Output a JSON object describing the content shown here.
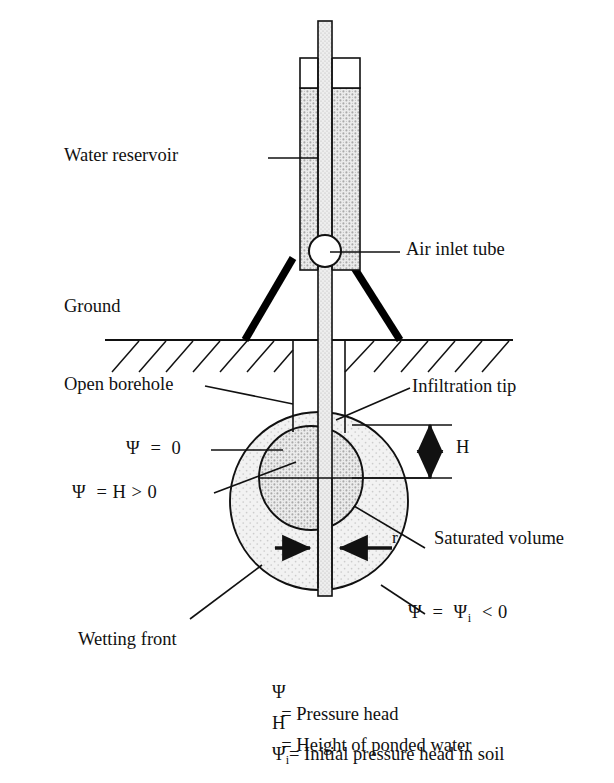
{
  "figure": {
    "type": "technical-diagram"
  },
  "labels": {
    "water_reservoir": "Water reservoir",
    "air_inlet_tube": "Air inlet tube",
    "ground": "Ground",
    "open_borehole": "Open borehole",
    "infiltration_tip": "Infiltration tip",
    "saturated_volume": "Saturated volume",
    "wetting_front": "Wetting front",
    "dim_H": "H",
    "dim_r": "r"
  },
  "annotations": {
    "psi_zero": {
      "psi": "Ψ",
      "rest": "  =  0"
    },
    "psi_H": {
      "psi": "Ψ",
      "rest": "  = H > 0"
    },
    "psi_i": {
      "psi": "Ψ",
      "mid": "  =  ",
      "psi2": "Ψ",
      "sub": "i",
      "rest": "  < 0"
    }
  },
  "legend": [
    {
      "sym": "Ψ",
      "sub": "",
      "text": "= Pressure head"
    },
    {
      "sym": "H",
      "sub": "",
      "text": "= Height of ponded water"
    },
    {
      "sym": "Ψ",
      "sub": "i",
      "text": "= Initial pressure head in soil"
    }
  ],
  "colors": {
    "line": "#111111",
    "leg_fill": "#000000",
    "reservoir_fill": "#e8e8e8",
    "saturated_fill": "#d9d9d9",
    "wetting_fill": "#ebebeb",
    "background": "#ffffff"
  }
}
